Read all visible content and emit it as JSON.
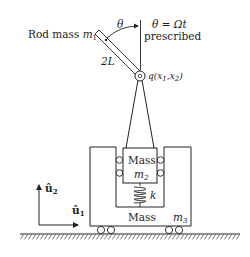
{
  "diagram": {
    "rod_label": "Rod mass",
    "rod_mass_symbol": "m",
    "rod_mass_sub": "1",
    "angle_symbol": "θ",
    "angle_equation": "θ = Ωt",
    "prescribed_label": "prescribed",
    "length_label": "2L",
    "pivot_label": "q(x",
    "pivot_x1_sub": "1",
    "pivot_sep": ",x",
    "pivot_x2_sub": "2",
    "pivot_close": ")",
    "inner_mass_label": "Mass",
    "inner_mass_symbol": "m",
    "inner_mass_sub": "2",
    "spring_label": "k",
    "outer_mass_label": "Mass",
    "outer_mass_symbol": "m",
    "outer_mass_sub": "3",
    "axis_u2_label": "û",
    "axis_u2_sub": "2",
    "axis_u1_label": "û",
    "axis_u1_sub": "1"
  },
  "colors": {
    "stroke": "#222222",
    "background": "#ffffff"
  }
}
